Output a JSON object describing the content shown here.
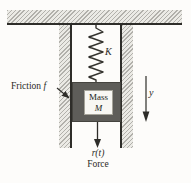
{
  "figure": {
    "spring_label": "K",
    "friction_word": "Friction",
    "friction_symbol": "f",
    "mass_word": "Mass",
    "mass_symbol": "M",
    "displacement_label": "y",
    "force_symbol": "r(t)",
    "force_word": "Force",
    "colors": {
      "ink": "#2e2d29",
      "hatch_background": "#ebeae5",
      "hatch_line": "#54524c",
      "mass_fill": "#5e5d59",
      "mass_label_box_fill": "#f8f7f3",
      "canvas_background": "#fdfcfa"
    }
  }
}
